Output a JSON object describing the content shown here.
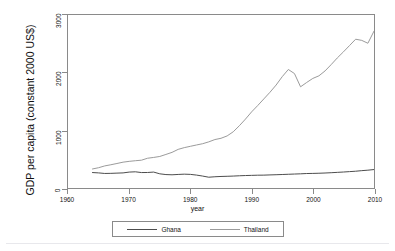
{
  "chart_data": {
    "type": "line",
    "title": "",
    "xlabel": "year",
    "ylabel": "GDP per capita (constant 2000 US$)",
    "xlim": [
      1960,
      2010
    ],
    "ylim": [
      0,
      3000
    ],
    "xticks": [
      1960,
      1970,
      1980,
      1990,
      2000,
      2010
    ],
    "xticklabels": [
      "1960",
      "1970",
      "1980",
      "1990",
      "2000",
      "2010"
    ],
    "yticks": [
      0,
      1000,
      2000,
      3000
    ],
    "yticklabels": [
      "0",
      "1000",
      "2000",
      "3000"
    ],
    "grid": false,
    "legend_position": "bottom",
    "x": [
      1964,
      1965,
      1966,
      1967,
      1968,
      1969,
      1970,
      1971,
      1972,
      1973,
      1974,
      1975,
      1976,
      1977,
      1978,
      1979,
      1980,
      1981,
      1982,
      1983,
      1984,
      1985,
      1986,
      1987,
      1988,
      1989,
      1990,
      1991,
      1992,
      1993,
      1994,
      1995,
      1996,
      1997,
      1998,
      1999,
      2000,
      2001,
      2002,
      2003,
      2004,
      2005,
      2006,
      2007,
      2008,
      2009,
      2010
    ],
    "series": [
      {
        "name": "Ghana",
        "color": "#4d4d4d",
        "values": [
          268,
          262,
          252,
          254,
          258,
          262,
          276,
          281,
          268,
          269,
          276,
          246,
          233,
          229,
          235,
          240,
          236,
          224,
          207,
          187,
          195,
          200,
          203,
          207,
          212,
          216,
          219,
          222,
          223,
          227,
          230,
          234,
          238,
          242,
          246,
          251,
          253,
          256,
          260,
          265,
          271,
          277,
          284,
          291,
          301,
          309,
          320
        ]
      },
      {
        "name": "Thailand",
        "color": "#9b9b9b",
        "values": [
          330,
          352,
          383,
          403,
          425,
          448,
          462,
          473,
          482,
          516,
          530,
          547,
          582,
          618,
          670,
          700,
          723,
          746,
          768,
          800,
          840,
          862,
          903,
          975,
          1080,
          1195,
          1320,
          1430,
          1545,
          1660,
          1785,
          1930,
          2055,
          1985,
          1755,
          1830,
          1900,
          1945,
          2030,
          2140,
          2255,
          2360,
          2470,
          2580,
          2560,
          2510,
          2720
        ]
      }
    ]
  },
  "axis": {
    "y_title": "GDP per capita (constant 2000 US$)",
    "x_title": "year"
  },
  "legend": {
    "items": [
      {
        "label": "Ghana",
        "color": "#4d4d4d"
      },
      {
        "label": "Thailand",
        "color": "#9b9b9b"
      }
    ]
  }
}
